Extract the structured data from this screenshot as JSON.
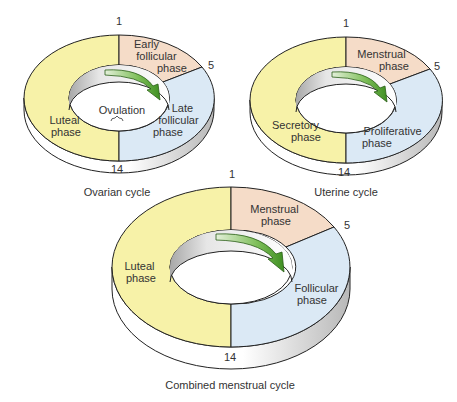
{
  "colors": {
    "luteal": "#f7f2a8",
    "early": "#f5dcc8",
    "late": "#dbe9f5",
    "arrow": "#4a9a2a",
    "arrow_light": "#cfe6bf",
    "outline": "#222222",
    "rim": "#ffffff",
    "rim_shade": "#bdbdbd"
  },
  "diagrams": [
    {
      "id": "ovarian",
      "caption": "Ovarian cycle",
      "day_markers": [
        "1",
        "5",
        "14"
      ],
      "segments": [
        {
          "label_lines": [
            "Early",
            "follicular",
            "phase"
          ],
          "color_key": "early"
        },
        {
          "label_lines": [
            "Late",
            "follicular",
            "phase"
          ],
          "color_key": "late"
        },
        {
          "label_lines": [
            "Luteal",
            "phase"
          ],
          "color_key": "luteal"
        }
      ],
      "center_label": "Ovulation"
    },
    {
      "id": "uterine",
      "caption": "Uterine cycle",
      "day_markers": [
        "1",
        "5",
        "14"
      ],
      "segments": [
        {
          "label_lines": [
            "Menstrual",
            "phase"
          ],
          "color_key": "early"
        },
        {
          "label_lines": [
            "Proliferative",
            "phase"
          ],
          "color_key": "late"
        },
        {
          "label_lines": [
            "Secretory",
            "phase"
          ],
          "color_key": "luteal"
        }
      ]
    },
    {
      "id": "combined",
      "caption": "Combined menstrual cycle",
      "day_markers": [
        "1",
        "5",
        "14"
      ],
      "segments": [
        {
          "label_lines": [
            "Menstrual",
            "phase"
          ],
          "color_key": "early"
        },
        {
          "label_lines": [
            "Follicular",
            "phase"
          ],
          "color_key": "late"
        },
        {
          "label_lines": [
            "Luteal",
            "phase"
          ],
          "color_key": "luteal"
        }
      ]
    }
  ]
}
